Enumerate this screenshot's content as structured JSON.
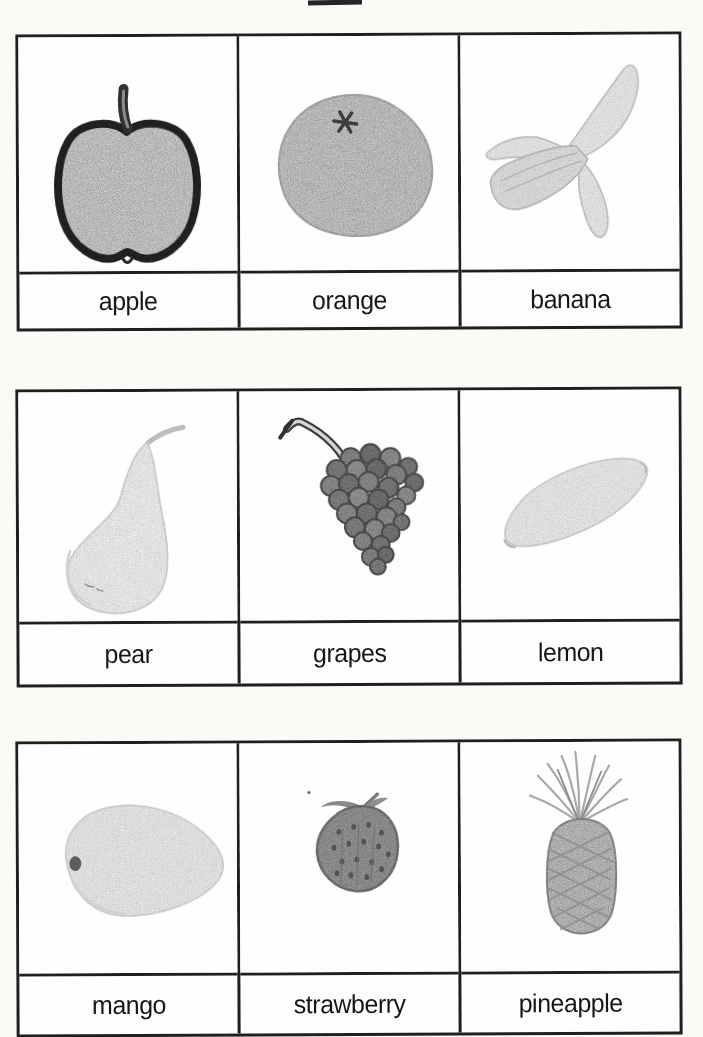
{
  "document": {
    "kind": "scanned fruit flashcards sheet",
    "rows_visible": 3,
    "columns": 3
  },
  "colors": {
    "page_bg": "#fbfaf7",
    "card_bg": "#fefefd",
    "border": "#1f1f1f",
    "label_text": "#161616",
    "pencil_light": "#ececec",
    "pencil_mid": "#cfcfcf",
    "pencil_dark": "#8f8f8f",
    "apple_outline": "#2b2b2b"
  },
  "cards_grid": {
    "rows": [
      {
        "cards": [
          {
            "label": "apple",
            "illustration": "apple-drawing"
          },
          {
            "label": "orange",
            "illustration": "orange-drawing"
          },
          {
            "label": "banana",
            "illustration": "peeled-banana-drawing"
          }
        ]
      },
      {
        "cards": [
          {
            "label": "pear",
            "illustration": "pear-drawing"
          },
          {
            "label": "grapes",
            "illustration": "grape-bunch-drawing"
          },
          {
            "label": "lemon",
            "illustration": "lemon-drawing"
          }
        ]
      },
      {
        "cards": [
          {
            "label": "mango",
            "illustration": "mango-drawing"
          },
          {
            "label": "strawberry",
            "illustration": "strawberry-drawing"
          },
          {
            "label": "pineapple",
            "illustration": "pineapple-drawing"
          }
        ]
      }
    ]
  }
}
